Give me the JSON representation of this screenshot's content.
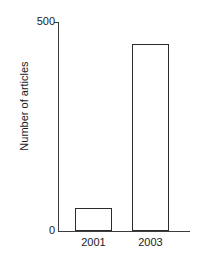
{
  "figure": {
    "background_color": "#ffffff",
    "axis_color": "#3c3c3c",
    "bar_edge_color": "#2b2b2b",
    "bar_fill_color": "#ffffff",
    "text_color": "#1a1a1a"
  },
  "chart_data": {
    "type": "bar",
    "title": "",
    "xlabel": "",
    "ylabel": "Number of articles",
    "categories": [
      "2001",
      "2003"
    ],
    "values": [
      55,
      447
    ],
    "ylim": [
      0,
      500
    ],
    "yticks": [
      0,
      500
    ],
    "ytick_labels": [
      "0",
      "500"
    ],
    "grid": false,
    "legend": false,
    "series": [
      {
        "name": "Number of articles",
        "values": [
          55,
          447
        ]
      }
    ]
  }
}
